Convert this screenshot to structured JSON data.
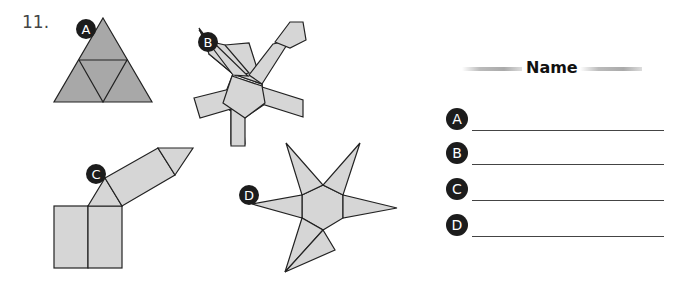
{
  "problem_number": "11.",
  "figures": [
    {
      "label": "A",
      "shape": "triangle-net"
    },
    {
      "label": "B",
      "shape": "pentagonal-prism-net"
    },
    {
      "label": "C",
      "shape": "triangular-prism-net"
    },
    {
      "label": "D",
      "shape": "pentagonal-pyramid-net"
    }
  ],
  "answer_sheet": {
    "header": "Name",
    "rows": [
      {
        "label": "A",
        "value": ""
      },
      {
        "label": "B",
        "value": ""
      },
      {
        "label": "C",
        "value": ""
      },
      {
        "label": "D",
        "value": ""
      }
    ]
  },
  "colors": {
    "dark_fill": "#a8a8a8",
    "light_fill": "#d6d6d6",
    "stroke": "#222222",
    "badge": "#1c1c1c"
  }
}
